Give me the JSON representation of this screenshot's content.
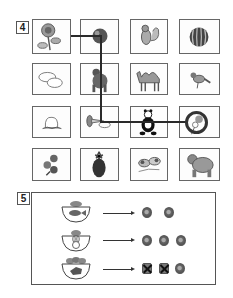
{
  "question4": {
    "label": "4",
    "grid": [
      [
        {
          "item": "sunflower"
        },
        {
          "item": "apple"
        },
        {
          "item": "squirrel"
        },
        {
          "item": "watermelon"
        }
      ],
      [
        {
          "item": "clouds"
        },
        {
          "item": "gorilla"
        },
        {
          "item": "camel"
        },
        {
          "item": "sparrow"
        }
      ],
      [
        {
          "item": "peach"
        },
        {
          "item": "trumpet"
        },
        {
          "item": "panda"
        },
        {
          "item": "lollipop-flowers"
        }
      ],
      [
        {
          "item": "flowers"
        },
        {
          "item": "pineapple"
        },
        {
          "item": "dogs"
        },
        {
          "item": "bear"
        }
      ]
    ],
    "path": [
      "sunflower",
      "apple",
      "gorilla",
      "trumpet",
      "panda",
      "lollipop-flowers"
    ],
    "circled": "lollipop-flowers"
  },
  "question5": {
    "label": "5",
    "rows": [
      {
        "bowl": "fish",
        "coins": 2,
        "crossed": 0
      },
      {
        "bowl": "rabbit",
        "coins": 3,
        "crossed": 0
      },
      {
        "bowl": "fox",
        "coins": 3,
        "crossed": 2
      }
    ]
  }
}
